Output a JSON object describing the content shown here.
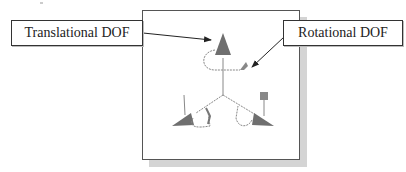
{
  "callouts": {
    "translational": "Translational DOF",
    "rotational": "Rotational DOF"
  },
  "triad": {
    "arrow_color": "#6e6e6e",
    "line_color": "#888888",
    "cone_color": "#7a7a7a"
  }
}
